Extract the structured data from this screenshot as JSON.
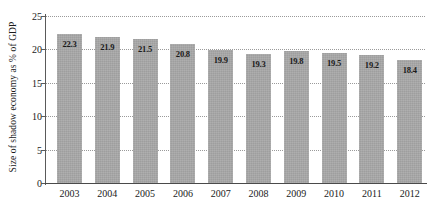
{
  "chart_data": {
    "type": "bar",
    "title": "",
    "xlabel": "",
    "ylabel": "Size of shadow economy as % of GDP",
    "categories": [
      "2003",
      "2004",
      "2005",
      "2006",
      "2007",
      "2008",
      "2009",
      "2010",
      "2011",
      "2012"
    ],
    "values": [
      22.3,
      21.9,
      21.5,
      20.8,
      19.9,
      19.3,
      19.8,
      19.5,
      19.2,
      18.4
    ],
    "value_labels": [
      "22.3",
      "21.9",
      "21.5",
      "20.8",
      "19.9",
      "19.3",
      "19.8",
      "19.5",
      "19.2",
      "18.4"
    ],
    "ylim": [
      0,
      25
    ],
    "y_ticks": [
      0,
      5,
      10,
      15,
      20,
      25
    ],
    "y_tick_labels": [
      "0",
      "5",
      "10",
      "15",
      "20",
      "25"
    ],
    "grid": true,
    "grid_style": "dotted-horizontal",
    "legend": "none",
    "bar_color": "#a9a9a9",
    "axis_color": "#4a4a4a",
    "grid_color": "#9a9a9a",
    "text_color": "#1a1a1a",
    "background": "#ffffff"
  }
}
